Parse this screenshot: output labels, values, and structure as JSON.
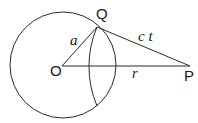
{
  "diagram": {
    "type": "geometry",
    "points": {
      "O": {
        "label": "O",
        "x": 62,
        "y": 66
      },
      "Q": {
        "label": "Q",
        "x": 97,
        "y": 27
      },
      "P": {
        "label": "P",
        "x": 190,
        "y": 66
      }
    },
    "circle": {
      "center": "O",
      "cx": 63,
      "cy": 65,
      "r": 53
    },
    "arc": {
      "center": "P",
      "from": "Q",
      "r": 101
    },
    "segments": [
      {
        "from": "O",
        "to": "Q",
        "label": "a"
      },
      {
        "from": "Q",
        "to": "P",
        "label": "ct"
      },
      {
        "from": "O",
        "to": "P",
        "label": "r"
      }
    ],
    "labels": {
      "O": "O",
      "Q": "Q",
      "P": "P",
      "a": "a",
      "ct": "c t",
      "r": "r"
    },
    "colors": {
      "line": "#2a2a2a",
      "background": "#ffffff"
    }
  }
}
